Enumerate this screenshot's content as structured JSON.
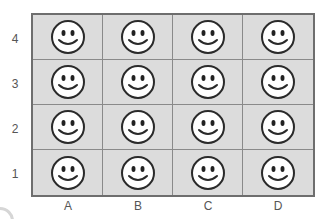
{
  "grid": {
    "rows": 4,
    "cols": 4,
    "cell_fill": "#dcdcdc",
    "border_color": "#6e6e6e",
    "icon": "smiley-face-icon"
  },
  "row_labels": [
    "4",
    "3",
    "2",
    "1"
  ],
  "col_labels": [
    "A",
    "B",
    "C",
    "D"
  ]
}
